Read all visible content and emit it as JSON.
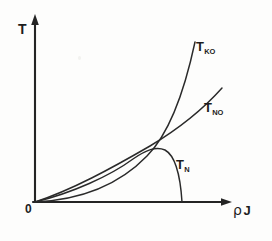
{
  "figure": {
    "kind": "phase-diagram",
    "background_color": "#fdfdfc",
    "ink_color": "#2a2a2a"
  },
  "axes": {
    "y": {
      "label": "T",
      "arrow": "up-arrow-icon",
      "x_px": 35,
      "top_px": 18,
      "bottom_px": 202
    },
    "x": {
      "label_rho": "ρ",
      "label_j": "J",
      "label_full": "ρ J",
      "arrow": "right-arrow-icon",
      "y_px": 202,
      "left_px": 33,
      "right_px": 228
    },
    "origin": {
      "label": "0",
      "x_px": 35,
      "y_px": 202
    }
  },
  "curves": [
    {
      "id": "t-ko",
      "label_main": "T",
      "label_sub": "KO",
      "shape": "exponential-rising",
      "path": "M 35 202 C 78 200, 118 186, 147 156 C 167 136, 183 98, 195 42",
      "label_x_px": 196,
      "label_y_px": 40
    },
    {
      "id": "t-no",
      "label_main": "T",
      "label_sub": "NO",
      "shape": "near-linear-rising",
      "path": "M 35 202 C 72 190, 112 168, 150 146 C 180 128, 206 106, 222 88",
      "label_x_px": 204,
      "label_y_px": 101
    },
    {
      "id": "t-n",
      "label_main": "T",
      "label_sub": "N",
      "shape": "neel-dome",
      "path": "M 35 202 C 72 193, 110 176, 133 159 C 146 150, 156 146, 165 150 C 174 155, 180 170, 182 202",
      "label_x_px": 176,
      "label_y_px": 158
    }
  ],
  "features": {
    "crossing_point": {
      "x_px": 167,
      "y_px": 132,
      "between": [
        "t-ko",
        "t-no"
      ]
    },
    "dome_peak": {
      "x_px": 150,
      "y_px": 147,
      "curve": "t-n"
    },
    "dome_right_foot": {
      "x_px": 182,
      "y_px": 202,
      "curve": "t-n"
    }
  }
}
